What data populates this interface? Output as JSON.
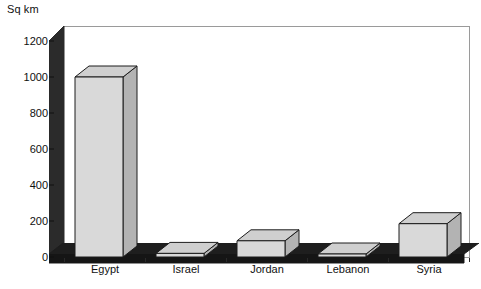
{
  "chart_data": {
    "type": "bar",
    "title": "",
    "subtitle": "",
    "xlabel": "",
    "ylabel": "Sq km",
    "axis_unit_title": "Sq km",
    "categories": [
      "Egypt",
      "Israel",
      "Jordan",
      "Lebanon",
      "Syria"
    ],
    "values": [
      1000,
      20,
      90,
      10,
      185
    ],
    "series": [
      {
        "name": "Area",
        "values": [
          1000,
          20,
          90,
          10,
          185
        ]
      }
    ],
    "ylim": [
      0,
      1200
    ],
    "ytick_labels": [
      "0",
      "200",
      "400",
      "600",
      "800",
      "1000",
      "1200"
    ],
    "ytick_values": [
      0,
      200,
      400,
      600,
      800,
      1000,
      1200
    ],
    "grid": false,
    "legend": false,
    "legend_position": "none",
    "style": "3d-column",
    "colors": {
      "bar_front": "#d9d9d9",
      "bar_top": "#cfcfcf",
      "bar_side": "#b3b3b3",
      "bar_outline": "#1c1c1c",
      "wall_left": "#2b2b2b",
      "floor": "#1e1e1e",
      "frame": "#9a9a9a",
      "text": "#101010",
      "background": "#ffffff"
    }
  }
}
